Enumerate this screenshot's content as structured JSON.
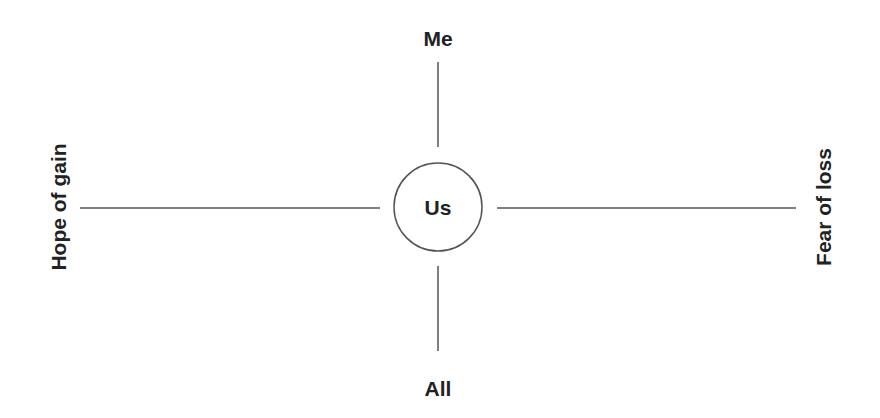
{
  "diagram": {
    "center_label": "Us",
    "top_label": "Me",
    "bottom_label": "All",
    "left_label": "Hope of gain",
    "right_label": "Fear of loss",
    "colors": {
      "line": "#555555",
      "text": "#222222",
      "background": "#ffffff"
    }
  }
}
